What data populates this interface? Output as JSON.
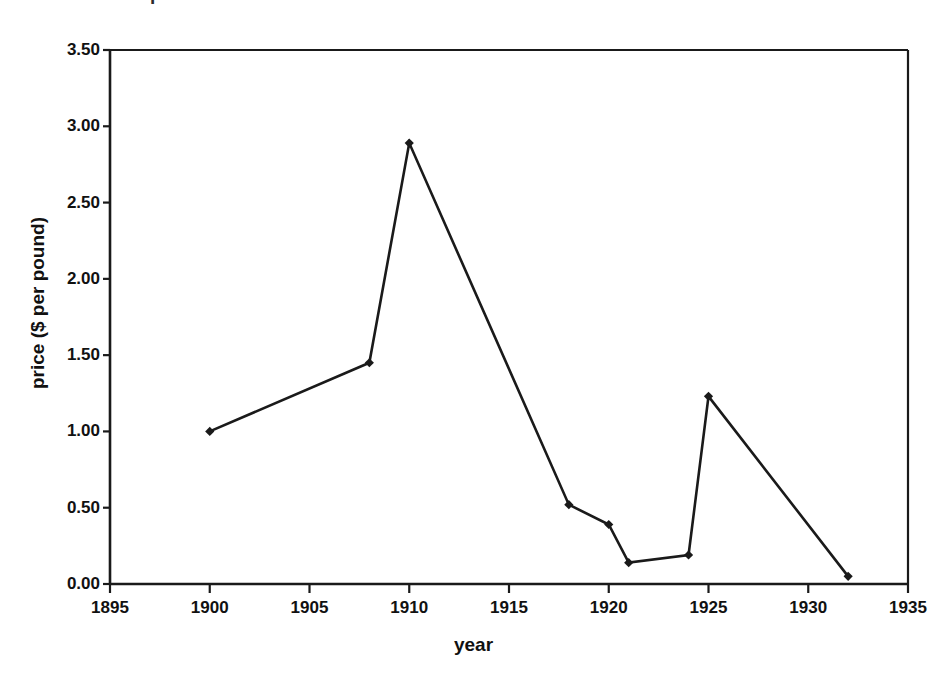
{
  "figure": {
    "clipped_title": "price of radium",
    "background_color": "#ffffff",
    "line_color": "#1a1a1a",
    "marker_color": "#1a1a1a",
    "axis_color": "#1a1a1a"
  },
  "chart_data": {
    "type": "line",
    "title": "",
    "xlabel": "year",
    "ylabel": "price ($ per pound)",
    "xlim": [
      1895,
      1935
    ],
    "ylim": [
      0.0,
      3.5
    ],
    "xticks": [
      1895,
      1900,
      1905,
      1910,
      1915,
      1920,
      1925,
      1930,
      1935
    ],
    "xticklabels": [
      "1895",
      "1900",
      "1905",
      "1910",
      "1915",
      "1920",
      "1925",
      "1930",
      "1935"
    ],
    "yticks": [
      0.0,
      0.5,
      1.0,
      1.5,
      2.0,
      2.5,
      3.0,
      3.5
    ],
    "yticklabels": [
      "0.00",
      "0.50",
      "1.00",
      "1.50",
      "2.00",
      "2.50",
      "3.00",
      "3.50"
    ],
    "grid": false,
    "legend": false,
    "marker": "diamond",
    "x": [
      1900,
      1908,
      1910,
      1918,
      1920,
      1921,
      1924,
      1925,
      1932
    ],
    "values": [
      1.0,
      1.45,
      2.89,
      0.52,
      0.39,
      0.14,
      0.19,
      1.23,
      0.05
    ],
    "series": [
      {
        "name": "price",
        "points": [
          {
            "x": 1900,
            "y": 1.0
          },
          {
            "x": 1908,
            "y": 1.45
          },
          {
            "x": 1910,
            "y": 2.89
          },
          {
            "x": 1918,
            "y": 0.52
          },
          {
            "x": 1920,
            "y": 0.39
          },
          {
            "x": 1921,
            "y": 0.14
          },
          {
            "x": 1924,
            "y": 0.19
          },
          {
            "x": 1925,
            "y": 1.23
          },
          {
            "x": 1932,
            "y": 0.05
          }
        ]
      }
    ]
  }
}
